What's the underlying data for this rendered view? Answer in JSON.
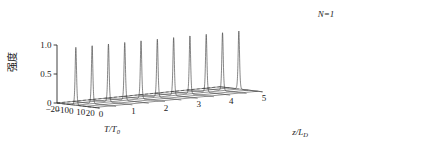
{
  "chart_data": {
    "type": "line",
    "title": "",
    "subtitle": "",
    "annotation": "N=1",
    "xlabel": "T/T0",
    "xlabel_main": "T/T",
    "xlabel_sub": "0",
    "ylabel": "强度",
    "zlabel": "z/LD",
    "zlabel_main": "z/L",
    "zlabel_sub": "D",
    "xlim": [
      -20,
      25
    ],
    "ylim": [
      0,
      1.0
    ],
    "zlim": [
      0,
      5
    ],
    "xticks": [
      -20,
      -10,
      0,
      10,
      20
    ],
    "xtick_labels": [
      "−20",
      "−10",
      "0",
      "10",
      "20"
    ],
    "yticks": [
      0,
      0.5,
      1.0
    ],
    "ytick_labels": [
      "0",
      "0.5",
      "1.0"
    ],
    "zticks": [
      0,
      1,
      2,
      3,
      4,
      5
    ],
    "ztick_labels": [
      "0",
      "1",
      "2",
      "3",
      "4",
      "5"
    ],
    "grid": true,
    "legend": "none",
    "n_traces": 11,
    "trace_z_values": [
      0.0,
      0.5,
      1.0,
      1.5,
      2.0,
      2.5,
      3.0,
      3.5,
      4.0,
      4.5,
      5.0
    ],
    "pulse_shape": "sech",
    "pulse_center_T": 0,
    "pulse_width_T0": 1.0,
    "peak_amplitude": 1.0,
    "series": [
      {
        "name": "z/LD = 0.0",
        "peak": 1.0,
        "center": 0,
        "width": 1.0
      },
      {
        "name": "z/LD = 0.5",
        "peak": 1.0,
        "center": 0,
        "width": 1.0
      },
      {
        "name": "z/LD = 1.0",
        "peak": 1.0,
        "center": 0,
        "width": 1.0
      },
      {
        "name": "z/LD = 1.5",
        "peak": 1.0,
        "center": 0,
        "width": 1.0
      },
      {
        "name": "z/LD = 2.0",
        "peak": 1.0,
        "center": 0,
        "width": 1.0
      },
      {
        "name": "z/LD = 2.5",
        "peak": 1.0,
        "center": 0,
        "width": 1.0
      },
      {
        "name": "z/LD = 3.0",
        "peak": 1.0,
        "center": 0,
        "width": 1.0
      },
      {
        "name": "z/LD = 3.5",
        "peak": 1.0,
        "center": 0,
        "width": 1.0
      },
      {
        "name": "z/LD = 4.0",
        "peak": 1.0,
        "center": 0,
        "width": 1.0
      },
      {
        "name": "z/LD = 4.5",
        "peak": 1.0,
        "center": 0,
        "width": 1.0
      },
      {
        "name": "z/LD = 5.0",
        "peak": 1.0,
        "center": 0,
        "width": 1.0
      }
    ],
    "colors": {
      "background": "#ffffff",
      "axis": "#2b2b2b",
      "curve": "#3a3a3a",
      "grid": "#3a3a3a",
      "text": "#1a1a1a"
    }
  }
}
